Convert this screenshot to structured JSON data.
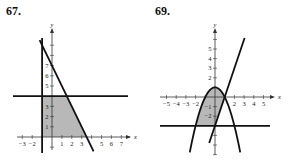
{
  "chart_data": [
    {
      "type": "line",
      "title": "67.",
      "xlabel": "x",
      "ylabel": "y",
      "xlim": [
        -3.5,
        7.8
      ],
      "ylim": [
        -1.5,
        9
      ],
      "x_ticks": [
        -3,
        -2,
        1,
        2,
        3,
        5,
        6,
        7
      ],
      "y_ticks": [
        1,
        2,
        3,
        5,
        6,
        7
      ],
      "grid": false,
      "series": [
        {
          "name": "boundary y = 4",
          "kind": "horizontal",
          "y": 4
        },
        {
          "name": "boundary x = -1",
          "kind": "vertical",
          "x": -1
        },
        {
          "name": "boundary y = 7 - 2x",
          "kind": "line",
          "slope": -2,
          "intercept": 7
        }
      ],
      "shaded_region": {
        "description": "region bounded by x = -1, y = 0, y = 4 and y = 7 - 2x",
        "vertices": [
          [
            -1,
            0
          ],
          [
            -1,
            4
          ],
          [
            1.5,
            4
          ],
          [
            3.5,
            0
          ]
        ]
      }
    },
    {
      "type": "line",
      "title": "69.",
      "xlabel": "x",
      "ylabel": "y",
      "xlim": [
        -5.5,
        5.8
      ],
      "ylim": [
        -5.5,
        6.5
      ],
      "x_ticks": [
        -5,
        -4,
        -3,
        -2,
        2,
        3,
        4,
        5
      ],
      "y_ticks": [
        5,
        4,
        3,
        2,
        -1,
        -2
      ],
      "grid": false,
      "series": [
        {
          "name": "boundary y = 1 - x^2",
          "kind": "parabola",
          "a": -1,
          "b": 0,
          "c": 1
        },
        {
          "name": "boundary y = 3x - 3",
          "kind": "line",
          "slope": 3,
          "intercept": -3
        },
        {
          "name": "boundary y = -3",
          "kind": "horizontal",
          "y": -3
        }
      ],
      "shaded_region": {
        "description": "region below parabola y = 1 - x^2, left of line y = 3x - 3, above y = -3"
      }
    }
  ],
  "headings": {
    "left": "67.",
    "right": "69."
  }
}
